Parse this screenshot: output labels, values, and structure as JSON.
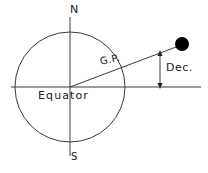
{
  "diagram": {
    "background_color": "#ffffff",
    "stroke_color": "#333333",
    "text_color": "#1a1a1a",
    "body_fill_color": "#000000",
    "labels": {
      "north_pole": "N",
      "south_pole": "S",
      "equator": "Equator",
      "geographical_position": "G.P.",
      "declination": "Dec."
    },
    "icons": {
      "celestial_body": "filled-circle",
      "declination_measure": "double-headed-arrow"
    },
    "geometry": {
      "earth_center_x": 70,
      "earth_center_y": 87,
      "earth_radius": 55,
      "equator_line_x1": 11,
      "equator_line_x2": 201,
      "equator_line_y": 87,
      "polar_axis_top_y": 17,
      "polar_axis_bottom_y": 156,
      "sight_line_x1": 70,
      "sight_line_y1": 87,
      "sight_line_x2": 180,
      "sight_line_y2": 45,
      "gp_point_x": 121,
      "gp_point_y": 68,
      "body_center_x": 182,
      "body_center_y": 44,
      "body_radius": 7,
      "dec_arrow_x": 160,
      "dec_arrow_top_y": 52,
      "dec_arrow_bottom_y": 87
    }
  }
}
